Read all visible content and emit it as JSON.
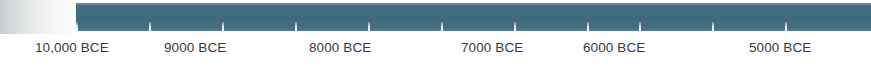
{
  "chart_data": {
    "type": "line",
    "title": "",
    "subtitle": "",
    "xlabel": "",
    "ylabel": "",
    "orientation": "horizontal",
    "axis_color": "#3f6a7d",
    "tick_color": "#ffffff",
    "label_color": "#3b3b3d",
    "background_color": "#ffffff",
    "grid": false,
    "legend": "none",
    "axis_range": [
      "10,000 BCE",
      "4500 BCE"
    ],
    "categories": [
      "10,000 BCE",
      "9000 BCE",
      "8000 BCE",
      "7000 BCE",
      "6000 BCE",
      "5000 BCE"
    ],
    "values": [
      10000,
      9000,
      8000,
      7000,
      6000,
      5000
    ],
    "tick_interval_years": 500,
    "labeled_tick_interval_years": 1000,
    "tick_positions_px": [
      76,
      149,
      222,
      295,
      368,
      441,
      514,
      587,
      639,
      712,
      785
    ],
    "labels": [
      {
        "text": "10,000 BCE",
        "value": 10000,
        "x": 35
      },
      {
        "text": "9000 BCE",
        "value": 9000,
        "x": 164
      },
      {
        "text": "8000 BCE",
        "value": 8000,
        "x": 309
      },
      {
        "text": "7000 BCE",
        "value": 7000,
        "x": 461
      },
      {
        "text": "6000 BCE",
        "value": 6000,
        "x": 583
      },
      {
        "text": "5000 BCE",
        "value": 5000,
        "x": 749
      }
    ],
    "ticks": [
      {
        "x": 76
      },
      {
        "x": 149
      },
      {
        "x": 222
      },
      {
        "x": 295
      },
      {
        "x": 368
      },
      {
        "x": 441
      },
      {
        "x": 514
      },
      {
        "x": 587
      },
      {
        "x": 639
      },
      {
        "x": 712
      },
      {
        "x": 785
      }
    ]
  },
  "axis": {
    "bar_name": "timeline-axis-bar",
    "left_shadow_name": "page-edge-shadow"
  }
}
